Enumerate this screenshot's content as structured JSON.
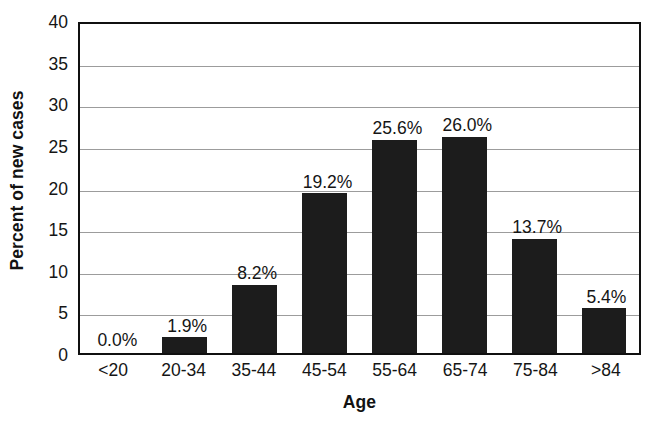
{
  "chart_data": {
    "type": "bar",
    "title": "",
    "subtitle": "",
    "xlabel": "Age",
    "ylabel": "Percent of new cases",
    "categories": [
      "<20",
      "20-34",
      "35-44",
      "45-54",
      "55-64",
      "65-74",
      "75-84",
      ">84"
    ],
    "values": [
      0.0,
      1.9,
      8.2,
      19.2,
      25.6,
      26.0,
      13.7,
      5.4
    ],
    "data_labels": [
      "0.0%",
      "1.9%",
      "8.2%",
      "19.2%",
      "25.6%",
      "26.0%",
      "13.7%",
      "5.4%"
    ],
    "ylim": [
      0,
      40
    ],
    "ytick_values": [
      0,
      5,
      10,
      15,
      20,
      25,
      30,
      35,
      40
    ],
    "ytick_labels": [
      "0",
      "5",
      "10",
      "15",
      "20",
      "25",
      "30",
      "35",
      "40"
    ],
    "grid": true,
    "grid_axis": "y",
    "legend": false,
    "legend_position": "none",
    "bar_color": "#1c1c1c",
    "gridline_color": "#9c9c9c",
    "axis_color": "#101010",
    "background_color": "#ffffff"
  }
}
